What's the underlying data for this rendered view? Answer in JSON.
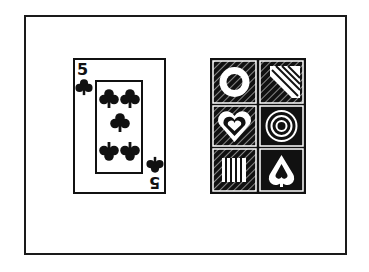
{
  "illustration": {
    "left_card": {
      "rank": "5",
      "suit": "clubs",
      "icon": "club-icon"
    },
    "right_card": {
      "type": "pattern card",
      "tiles": [
        {
          "shape": "ring",
          "icon": "ring-icon"
        },
        {
          "shape": "diagonal-stripes",
          "icon": "stripes-icon"
        },
        {
          "shape": "concentric-hearts",
          "icon": "heart-icon"
        },
        {
          "shape": "concentric-circles",
          "icon": "circles-icon"
        },
        {
          "shape": "vertical-stripes",
          "icon": "bars-icon"
        },
        {
          "shape": "inverted-heart",
          "icon": "spade-heart-icon"
        }
      ]
    },
    "colors": {
      "ink": "#111111",
      "paper": "#ffffff"
    }
  }
}
